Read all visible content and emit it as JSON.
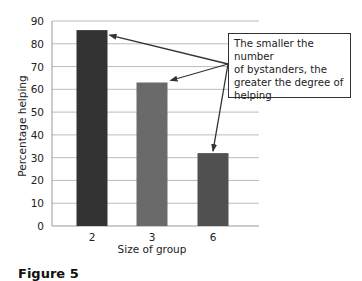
{
  "chart_data": {
    "type": "bar",
    "title": "",
    "xlabel": "Size of group",
    "ylabel": "Percentage helping",
    "categories": [
      "2",
      "3",
      "6"
    ],
    "values": [
      86,
      63,
      32
    ],
    "ylim": [
      0,
      90
    ],
    "yticks": [
      0,
      10,
      20,
      30,
      40,
      50,
      60,
      70,
      80,
      90
    ],
    "grid": true,
    "legend": null,
    "bar_colors": [
      "#333333",
      "#6a6a6a",
      "#505050"
    ],
    "annotations": [
      {
        "text": "The smaller the number of bystanders, the greater the degree of helping",
        "points_to": [
          "2",
          "3",
          "6"
        ]
      }
    ]
  },
  "annotation": {
    "line1": "The smaller the number",
    "line2": "of bystanders, the",
    "line3": "greater the degree of",
    "line4": "helping"
  },
  "caption": "Figure 5"
}
